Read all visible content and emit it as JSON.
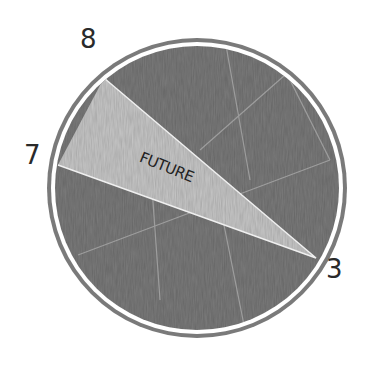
{
  "drawing": {
    "type": "clock-face-pie",
    "labels": {
      "eight": "8",
      "seven": "7",
      "three": "3",
      "wedge": "FUTURE"
    },
    "colors": {
      "background": "#ffffff",
      "disc_dark": "#7a7a7a",
      "wedge_light": "#c8c8c8",
      "ring_outline": "#6e6e6e",
      "ring_gap": "#ffffff",
      "text": "#2a2a2a"
    }
  }
}
